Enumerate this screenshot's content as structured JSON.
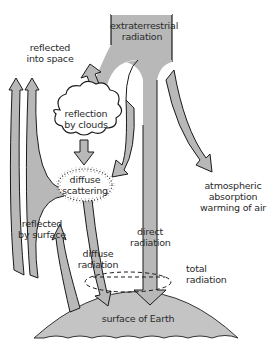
{
  "diagram": {
    "colors": {
      "arrow_fill": "#b8b8b8",
      "arrow_stroke": "#1a1a1a",
      "earth_fill": "#c4c4c4",
      "background": "#ffffff",
      "text": "#2a2a2a"
    },
    "labels": {
      "extraterrestrial_radiation": [
        "extraterrestrial",
        "radiation"
      ],
      "reflected_into_space": [
        "reflected",
        "into space"
      ],
      "reflection_by_clouds": [
        "reflection",
        "by clouds"
      ],
      "diffuse_scattering": [
        "diffuse",
        "scattering"
      ],
      "atmospheric_absorption": [
        "atmospheric",
        "absorption",
        "warming of air"
      ],
      "reflected_by_surface": [
        "reflected",
        "by surface"
      ],
      "direct_radiation": [
        "direct",
        "radiation"
      ],
      "diffuse_radiation": [
        "diffuse",
        "radiation"
      ],
      "total_radiation": [
        "total",
        "radiation"
      ],
      "surface_of_earth": "surface of Earth"
    },
    "nodes": [
      {
        "id": "extraterrestrial",
        "type": "source-band"
      },
      {
        "id": "clouds",
        "type": "cloud"
      },
      {
        "id": "scattering",
        "type": "dotted-cloud"
      },
      {
        "id": "earth",
        "type": "surface"
      },
      {
        "id": "total",
        "type": "dashed-ellipse"
      }
    ],
    "flows": [
      {
        "from": "extraterrestrial",
        "to": "clouds",
        "label": "reflection by clouds"
      },
      {
        "from": "clouds",
        "to": "space",
        "label": "reflected into space"
      },
      {
        "from": "clouds",
        "to": "scattering"
      },
      {
        "from": "extraterrestrial",
        "to": "scattering"
      },
      {
        "from": "extraterrestrial",
        "to": "atmosphere",
        "label": "atmospheric absorption warming of air"
      },
      {
        "from": "extraterrestrial",
        "to": "earth",
        "label": "direct radiation"
      },
      {
        "from": "scattering",
        "to": "earth",
        "label": "diffuse radiation"
      },
      {
        "from": "scattering",
        "to": "space"
      },
      {
        "from": "earth",
        "to": "space",
        "label": "reflected by surface"
      }
    ]
  }
}
